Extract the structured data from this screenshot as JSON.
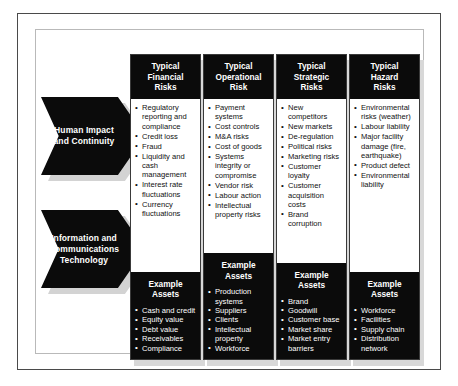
{
  "figure": {
    "row_labels": [
      {
        "id": "human-impact-and-continuity",
        "line1": "Human Impact",
        "line2": "and Continuity"
      },
      {
        "id": "information-and-communications-technology",
        "line1": "Information and",
        "line2": "Communications",
        "line3": "Technology"
      }
    ],
    "columns": [
      {
        "id": "financial",
        "header": "Typical Financial Risks",
        "header_lines": [
          "Typical",
          "Financial",
          "Risks"
        ],
        "risks": [
          "Regulatory reporting and compliance",
          "Credit loss",
          "Fraud",
          "Liquidity and cash management",
          "Interest rate fluctuations",
          "Currency fluctuations"
        ],
        "assets_title_lines": [
          "Example",
          "Assets"
        ],
        "assets": [
          "Cash and credit",
          "Equity value",
          "Debt value",
          "Receivables",
          "Compliance"
        ]
      },
      {
        "id": "operational",
        "header": "Typical Operational Risk",
        "header_lines": [
          "Typical",
          "Operational",
          "Risk"
        ],
        "risks": [
          "Payment systems",
          "Cost controls",
          "M&A risks",
          "Cost of goods",
          "Systems integrity or compromise",
          "Vendor risk",
          "Labour action",
          "Intellectual property risks"
        ],
        "assets_title_lines": [
          "Example",
          "Assets"
        ],
        "assets": [
          "Production systems",
          "Suppliers",
          "Clients",
          "Intellectual property",
          "Workforce"
        ]
      },
      {
        "id": "strategic",
        "header": "Typical Strategic Risks",
        "header_lines": [
          "Typical",
          "Strategic",
          "Risks"
        ],
        "risks": [
          "New competitors",
          "New markets",
          "De-regulation",
          "Political risks",
          "Marketing risks",
          "Customer loyalty",
          "Customer acquisition costs",
          "Brand corruption"
        ],
        "assets_title_lines": [
          "Example",
          "Assets"
        ],
        "assets": [
          "Brand",
          "Goodwill",
          "Customer base",
          "Market share",
          "Market entry barriers"
        ]
      },
      {
        "id": "hazard",
        "header": "Typical Hazard Risks",
        "header_lines": [
          "Typical",
          "Hazard",
          "Risks"
        ],
        "risks": [
          "Environmental risks (weather)",
          "Labour liability",
          "Major facility damage (fire, earthquake)",
          "Product defect",
          "Environmental liability"
        ],
        "assets_title_lines": [
          "Example",
          "Assets"
        ],
        "assets": [
          "Workforce",
          "Facilities",
          "Supply chain",
          "Distribution network"
        ]
      }
    ],
    "colors": {
      "black_block": "#0b0b0b",
      "shadow_gray": "#d8d8d8",
      "outer_frame": "#4a4a4a",
      "inner_frame": "#b9b9b9",
      "page_background": "#ffffff",
      "body_text": "#111111",
      "inverse_text": "#ffffff"
    }
  }
}
